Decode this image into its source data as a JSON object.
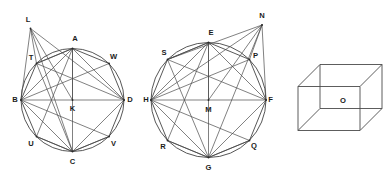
{
  "figure": {
    "background_color": "#ffffff",
    "line_color": "#3a3a3a",
    "label_color": "#1b1b1b",
    "panels": [
      {
        "id": "panel-left-circle",
        "name": "left-circle-figure",
        "center_label": "K",
        "circle": {
          "cx": 72.5,
          "cy": 100.0,
          "r": 51.5
        },
        "points": [
          {
            "label": "B",
            "x": 21.0,
            "y": 100.0,
            "lx": 15.0,
            "ly": 100.0
          },
          {
            "label": "T",
            "x": 36.5,
            "y": 63.5,
            "lx": 31.0,
            "ly": 58.0
          },
          {
            "label": "A",
            "x": 72.5,
            "y": 48.5,
            "lx": 75.0,
            "ly": 38.5
          },
          {
            "label": "W",
            "x": 109.0,
            "y": 63.5,
            "lx": 113.5,
            "ly": 57.0
          },
          {
            "label": "D",
            "x": 124.0,
            "y": 100.0,
            "lx": 130.0,
            "ly": 100.0
          },
          {
            "label": "V",
            "x": 109.0,
            "y": 136.5,
            "lx": 113.5,
            "ly": 144.0
          },
          {
            "label": "C",
            "x": 72.5,
            "y": 151.5,
            "lx": 72.5,
            "ly": 162.0
          },
          {
            "label": "U",
            "x": 36.5,
            "y": 136.5,
            "lx": 31.0,
            "ly": 144.0
          },
          {
            "label": "K",
            "x": 72.5,
            "y": 100.0,
            "lx": 72.5,
            "ly": 109.0
          },
          {
            "label": "L",
            "x": 30.5,
            "y": 28.5,
            "lx": 28.0,
            "ly": 20.0
          }
        ],
        "diameter_chord": [
          "B",
          "D"
        ],
        "polygon": [
          "B",
          "T",
          "A",
          "W",
          "D",
          "V",
          "C",
          "U"
        ],
        "extra_segments": [
          [
            "B",
            "A"
          ],
          [
            "B",
            "W"
          ],
          [
            "B",
            "D"
          ],
          [
            "B",
            "V"
          ],
          [
            "B",
            "C"
          ],
          [
            "A",
            "D"
          ],
          [
            "A",
            "C"
          ],
          [
            "A",
            "K"
          ],
          [
            "A",
            "T"
          ],
          [
            "A",
            "U"
          ],
          [
            "T",
            "D"
          ],
          [
            "T",
            "C"
          ],
          [
            "U",
            "C"
          ],
          [
            "C",
            "D"
          ],
          [
            "C",
            "V"
          ],
          [
            "L",
            "B"
          ],
          [
            "L",
            "T"
          ],
          [
            "L",
            "K"
          ],
          [
            "L",
            "D"
          ],
          [
            "L",
            "C"
          ]
        ]
      },
      {
        "id": "panel-middle-circle",
        "name": "middle-circle-figure",
        "center_label": "M",
        "circle": {
          "cx": 208.5,
          "cy": 100.0,
          "r": 57.5
        },
        "points": [
          {
            "label": "H",
            "x": 151.0,
            "y": 100.0,
            "lx": 146.0,
            "ly": 100.0
          },
          {
            "label": "S",
            "x": 167.5,
            "y": 59.5,
            "lx": 164.0,
            "ly": 53.0
          },
          {
            "label": "E",
            "x": 208.5,
            "y": 42.5,
            "lx": 211.0,
            "ly": 32.5
          },
          {
            "label": "P",
            "x": 249.5,
            "y": 59.5,
            "lx": 255.5,
            "ly": 55.5
          },
          {
            "label": "F",
            "x": 266.0,
            "y": 100.0,
            "lx": 270.5,
            "ly": 100.0
          },
          {
            "label": "Q",
            "x": 249.5,
            "y": 140.5,
            "lx": 254.0,
            "ly": 146.0
          },
          {
            "label": "G",
            "x": 208.5,
            "y": 157.5,
            "lx": 208.5,
            "ly": 167.5
          },
          {
            "label": "R",
            "x": 167.5,
            "y": 140.5,
            "lx": 163.0,
            "ly": 146.5
          },
          {
            "label": "M",
            "x": 208.5,
            "y": 100.0,
            "lx": 208.5,
            "ly": 109.5
          },
          {
            "label": "N",
            "x": 262.0,
            "y": 25.0,
            "lx": 262.0,
            "ly": 16.0
          }
        ],
        "diameter_chord": [
          "H",
          "F"
        ],
        "polygon": [
          "H",
          "S",
          "E",
          "P",
          "F",
          "Q",
          "G",
          "R"
        ],
        "extra_segments": [
          [
            "H",
            "E"
          ],
          [
            "H",
            "P"
          ],
          [
            "H",
            "F"
          ],
          [
            "H",
            "Q"
          ],
          [
            "H",
            "G"
          ],
          [
            "E",
            "F"
          ],
          [
            "E",
            "G"
          ],
          [
            "E",
            "M"
          ],
          [
            "E",
            "S"
          ],
          [
            "E",
            "R"
          ],
          [
            "S",
            "F"
          ],
          [
            "S",
            "G"
          ],
          [
            "R",
            "G"
          ],
          [
            "G",
            "F"
          ],
          [
            "G",
            "Q"
          ],
          [
            "N",
            "H"
          ],
          [
            "N",
            "S"
          ],
          [
            "N",
            "M"
          ],
          [
            "N",
            "F"
          ],
          [
            "N",
            "G"
          ],
          [
            "N",
            "P"
          ]
        ]
      },
      {
        "id": "panel-box",
        "name": "box-figure",
        "center_label": "O",
        "label_position": {
          "x": 343.0,
          "y": 101.0
        },
        "front_face": {
          "x": 298.0,
          "y": 86.5,
          "w": 62.0,
          "h": 44.0
        },
        "depth_offset": {
          "dx": 22.0,
          "dy": -22.0
        },
        "hidden_edges": [
          "back-left-vertical",
          "back-bottom-horizontal",
          "back-left-depth"
        ]
      }
    ]
  },
  "labels": {
    "left": [
      "L",
      "A",
      "W",
      "T",
      "B",
      "K",
      "D",
      "U",
      "C",
      "V"
    ],
    "middle": [
      "N",
      "E",
      "S",
      "P",
      "H",
      "M",
      "F",
      "R",
      "G",
      "Q"
    ],
    "right": [
      "O"
    ]
  }
}
